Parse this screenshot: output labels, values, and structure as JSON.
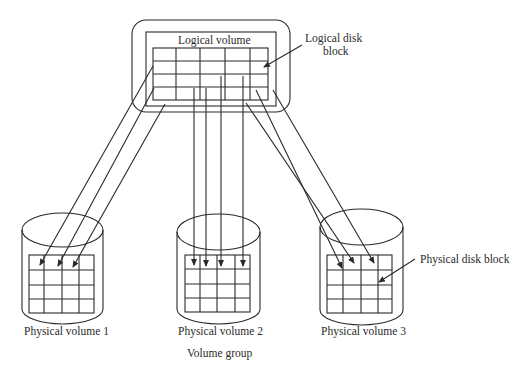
{
  "diagram": {
    "logical_volume": {
      "title": "Logical volume",
      "grid": {
        "rows": 4,
        "cols": 5
      }
    },
    "callouts": {
      "logical_disk_block_line1": "Logical disk",
      "logical_disk_block_line2": "block",
      "physical_disk_block": "Physical disk block"
    },
    "physical_volumes": [
      {
        "label": "Physical volume 1",
        "grid": {
          "rows": 4,
          "cols": 4
        }
      },
      {
        "label": "Physical volume 2",
        "grid": {
          "rows": 4,
          "cols": 4
        }
      },
      {
        "label": "Physical volume 3",
        "grid": {
          "rows": 4,
          "cols": 4
        }
      }
    ],
    "group_label": "Volume group",
    "colors": {
      "stroke": "#2a2a2a",
      "background": "#ffffff"
    }
  }
}
